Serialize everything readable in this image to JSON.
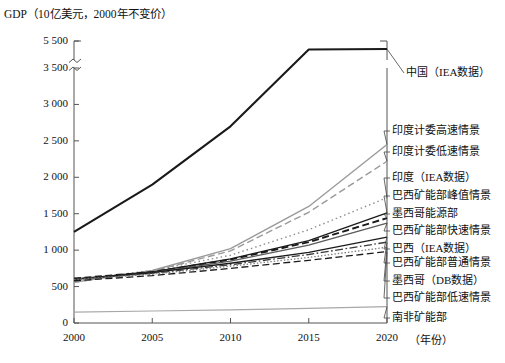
{
  "chart_data": {
    "type": "line",
    "title": "GDP（10亿美元，2000年不变价）",
    "ylabel": "GDP（10亿美元，2000年不变价）",
    "xlabel": "年份",
    "xlabel_display": "（年份）",
    "grid": false,
    "legend_position": "right-inline-labels",
    "x": [
      2000,
      2005,
      2010,
      2015,
      2020
    ],
    "xlim": [
      2000,
      2020
    ],
    "xticks": [
      "2000",
      "2005",
      "2010",
      "2015",
      "2020"
    ],
    "ylim": [
      0,
      5500
    ],
    "y_axis_break": {
      "from": 3500,
      "to": 5500,
      "note": "轴断裂"
    },
    "yticks": [
      "0",
      "500",
      "1 000",
      "1 500",
      "2 000",
      "2 500",
      "3 000",
      "3 500",
      "5 500"
    ],
    "ytick_values": [
      0,
      500,
      1000,
      1500,
      2000,
      2500,
      3000,
      3500,
      5500
    ],
    "colors": {
      "black": "#1a1a1a",
      "gray": "#8d8d8d",
      "light_gray": "#b5b5b5",
      "axis": "#555555"
    },
    "series": [
      {
        "name": "中国 (IEA数据)",
        "label": "中国（IEA数据）",
        "style": "solid",
        "color": "#1a1a1a",
        "width": 2.1,
        "values": [
          1250,
          1900,
          2700,
          4600,
          4650
        ]
      },
      {
        "name": "印度计委高速情景",
        "label": "印度计委高速情景",
        "style": "solid",
        "color": "#9a9a9a",
        "width": 1.4,
        "values": [
          560,
          720,
          1020,
          1600,
          2450
        ]
      },
      {
        "name": "印度计委低速情景",
        "label": "印度计委低速情景",
        "style": "dashed",
        "color": "#9a9a9a",
        "width": 1.4,
        "values": [
          560,
          710,
          990,
          1520,
          2220
        ]
      },
      {
        "name": "印度 (IEA数据)",
        "label": "印度（IEA数据）",
        "style": "dotted",
        "color": "#8f8f8f",
        "width": 1.4,
        "values": [
          590,
          720,
          930,
          1280,
          1720
        ]
      },
      {
        "name": "巴西矿能部峰值情景",
        "label": "巴西矿能部峰值情景",
        "style": "solid",
        "color": "#1a1a1a",
        "width": 1.3,
        "values": [
          600,
          700,
          880,
          1130,
          1510
        ]
      },
      {
        "name": "墨西哥能源部",
        "label": "墨西哥能源部",
        "style": "dashed",
        "color": "#1a1a1a",
        "width": 1.9,
        "values": [
          610,
          700,
          870,
          1110,
          1440
        ]
      },
      {
        "name": "巴西矿能部快速情景",
        "label": "巴西矿能部快速情景",
        "style": "solid",
        "color": "#5a5a5a",
        "width": 1.3,
        "values": [
          600,
          690,
          850,
          1070,
          1370
        ]
      },
      {
        "name": "巴西 (IEA数据)",
        "label": "巴西（IEA数据）",
        "style": "solid",
        "color": "#1a1a1a",
        "width": 1.3,
        "values": [
          605,
          690,
          820,
          970,
          1180
        ]
      },
      {
        "name": "巴西矿能部普通情景",
        "label": "巴西矿能部普通情景",
        "style": "dash-dot",
        "color": "#3a3a3a",
        "width": 1.3,
        "values": [
          600,
          680,
          800,
          940,
          1110
        ]
      },
      {
        "name": "墨西哥 (DB数据)",
        "label": "墨西哥（DB数据）",
        "style": "dotted-dense",
        "color": "#7a7a7a",
        "width": 1.3,
        "values": [
          595,
          670,
          780,
          900,
          1040
        ]
      },
      {
        "name": "巴西矿能部低速情景",
        "label": "巴西矿能部低速情景",
        "style": "dashed",
        "color": "#1a1a1a",
        "width": 1.3,
        "values": [
          580,
          650,
          750,
          860,
          980
        ]
      },
      {
        "name": "南非矿能部",
        "label": "南非矿能部",
        "style": "solid",
        "color": "#a8a8a8",
        "width": 1.2,
        "values": [
          150,
          165,
          180,
          200,
          225
        ]
      }
    ],
    "annotations": [
      {
        "text": "中国（IEA数据）",
        "x_px": 406,
        "y_px": 73
      },
      {
        "text": "印度计委高速情景",
        "x_px": 392,
        "y_px": 131
      },
      {
        "text": "印度计委低速情景",
        "x_px": 392,
        "y_px": 152
      },
      {
        "text": "印度（IEA数据）",
        "x_px": 392,
        "y_px": 178
      },
      {
        "text": "巴西矿能部峰值情景",
        "x_px": 392,
        "y_px": 196
      },
      {
        "text": "墨西哥能源部",
        "x_px": 392,
        "y_px": 214
      },
      {
        "text": "巴西矿能部快速情景",
        "x_px": 392,
        "y_px": 231
      },
      {
        "text": "巴西（IEA数据）",
        "x_px": 392,
        "y_px": 249
      },
      {
        "text": "巴西矿能部普通情景",
        "x_px": 392,
        "y_px": 263
      },
      {
        "text": "墨西哥（DB数据）",
        "x_px": 392,
        "y_px": 281
      },
      {
        "text": "巴西矿能部低速情景",
        "x_px": 392,
        "y_px": 298
      },
      {
        "text": "南非矿能部",
        "x_px": 392,
        "y_px": 318
      }
    ]
  }
}
